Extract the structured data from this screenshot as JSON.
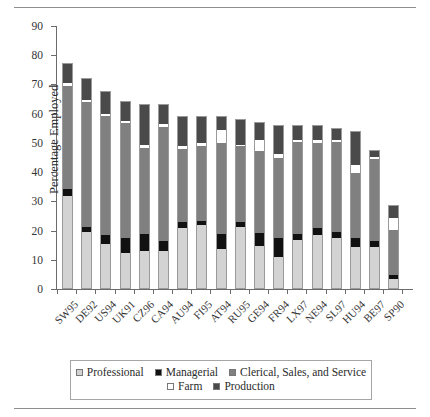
{
  "chart_data": {
    "type": "bar",
    "subtype": "stacked-bar",
    "title": "",
    "xlabel": "Country-Year",
    "ylabel": "Percentage Employed",
    "ylim": [
      0,
      90
    ],
    "ytick_step": 10,
    "yticks": [
      0,
      10,
      20,
      30,
      40,
      50,
      60,
      70,
      80,
      90
    ],
    "grid": false,
    "legend_position": "bottom",
    "categories": [
      "SW95",
      "DE92",
      "US94",
      "UK91",
      "CZ96",
      "CA94",
      "AU94",
      "FI95",
      "AT94",
      "RU95",
      "GE94",
      "FR94",
      "LX97",
      "NE94",
      "SL97",
      "HU94",
      "BE97",
      "SP90"
    ],
    "series": [
      {
        "name": "Professional",
        "color": "#d3d3d3",
        "values": [
          31.5,
          19.0,
          15.0,
          12.0,
          12.5,
          12.5,
          20.5,
          21.5,
          13.5,
          21.0,
          14.5,
          10.5,
          16.5,
          18.0,
          17.0,
          14.0,
          14.0,
          3.0
        ]
      },
      {
        "name": "Managerial",
        "color": "#111111",
        "values": [
          2.5,
          2.0,
          3.0,
          5.0,
          6.0,
          3.5,
          2.0,
          1.5,
          5.0,
          1.5,
          4.5,
          6.5,
          2.0,
          2.5,
          2.0,
          3.0,
          2.0,
          1.5
        ]
      },
      {
        "name": "Clerical, Sales, and Service",
        "color": "#808080",
        "values": [
          35.0,
          42.5,
          41.0,
          39.5,
          29.5,
          39.0,
          25.0,
          25.5,
          31.0,
          26.0,
          28.0,
          27.5,
          31.5,
          29.0,
          31.0,
          22.5,
          28.0,
          15.5
        ]
      },
      {
        "name": "Farm",
        "color": "#ffffff",
        "values": [
          1.0,
          1.0,
          0.5,
          0.5,
          1.0,
          1.0,
          1.0,
          1.0,
          4.5,
          0.5,
          3.5,
          1.5,
          0.5,
          1.0,
          0.5,
          2.5,
          1.0,
          4.0
        ]
      },
      {
        "name": "Production",
        "color": "#4a4a4a",
        "values": [
          6.5,
          7.0,
          7.5,
          6.5,
          13.5,
          6.5,
          10.0,
          9.0,
          4.5,
          8.5,
          6.0,
          9.5,
          5.0,
          5.0,
          4.0,
          11.5,
          2.0,
          4.0
        ]
      }
    ],
    "totals": [
      76.5,
      71.5,
      67.0,
      63.5,
      62.5,
      62.5,
      58.5,
      58.5,
      58.5,
      57.5,
      56.5,
      55.5,
      55.5,
      55.5,
      54.5,
      53.5,
      47.0,
      28.0
    ]
  },
  "legend": {
    "items": [
      {
        "label": "Professional",
        "swatch": "professional-swatch"
      },
      {
        "label": "Managerial",
        "swatch": "managerial-swatch"
      },
      {
        "label": "Clerical, Sales, and Service",
        "swatch": "clerical-swatch"
      },
      {
        "label": "Farm",
        "swatch": "farm-swatch"
      },
      {
        "label": "Production",
        "swatch": "production-swatch"
      }
    ]
  }
}
